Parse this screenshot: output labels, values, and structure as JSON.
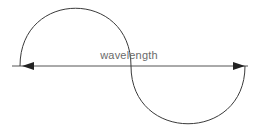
{
  "diagram": {
    "label": "wavelength",
    "colors": {
      "stroke": "#3a3a3a",
      "axis": "#555555",
      "label": "#6a6a6a",
      "background": "#ffffff"
    },
    "elements": [
      {
        "type": "axis-line",
        "from": [
          12,
          66
        ],
        "to": [
          248,
          66
        ]
      },
      {
        "type": "arc",
        "position": "upper-left",
        "start": [
          20,
          66
        ],
        "end": [
          131,
          66
        ],
        "apex": [
          75,
          7
        ]
      },
      {
        "type": "arc",
        "position": "lower-right",
        "start": [
          131,
          66
        ],
        "end": [
          245,
          66
        ],
        "apex": [
          188,
          123
        ]
      },
      {
        "type": "arrowhead",
        "direction": "left",
        "tip": [
          22,
          66
        ]
      },
      {
        "type": "arrowhead",
        "direction": "right",
        "tip": [
          245,
          66
        ]
      }
    ]
  }
}
